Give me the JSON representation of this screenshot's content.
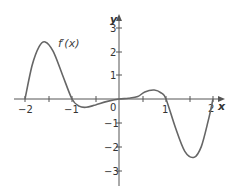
{
  "chart_data": {
    "type": "line",
    "title": "",
    "xlabel": "x",
    "ylabel": "y",
    "xlim": [
      -2.2,
      2.3
    ],
    "ylim": [
      -3.5,
      3.5
    ],
    "grid": false,
    "x_ticks": [
      "-2",
      "-1",
      "0",
      "1",
      "2"
    ],
    "y_ticks": [
      "3",
      "2",
      "1",
      "-1",
      "-2",
      "-3"
    ],
    "annotations": [
      {
        "text": "f′(x)",
        "x": -1.2,
        "y": 2.3
      }
    ],
    "series": [
      {
        "name": "f′(x)",
        "x": [
          -2.0,
          -1.85,
          -1.7,
          -1.57,
          -1.4,
          -1.2,
          -1.0,
          -0.85,
          -0.7,
          -0.5,
          -0.25,
          0.0,
          0.2,
          0.4,
          0.55,
          0.75,
          0.9,
          1.0,
          1.2,
          1.4,
          1.6,
          1.75,
          1.9,
          2.0
        ],
        "values": [
          0.0,
          1.4,
          2.2,
          2.4,
          2.0,
          1.0,
          0.0,
          -0.3,
          -0.35,
          -0.25,
          -0.1,
          0.0,
          0.03,
          0.1,
          0.3,
          0.38,
          0.25,
          0.0,
          -1.2,
          -2.2,
          -2.45,
          -2.0,
          -0.9,
          0.0
        ]
      }
    ]
  },
  "labels": {
    "x_axis": "x",
    "y_axis": "y",
    "curve": "f′(x)",
    "xt_m2": "−2",
    "xt_m1": "−1",
    "xt_0": "0",
    "xt_1": "1",
    "xt_2": "2",
    "yt_3": "3",
    "yt_2": "2",
    "yt_1": "1",
    "yt_m1": "−1",
    "yt_m2": "−2",
    "yt_m3": "−3"
  }
}
